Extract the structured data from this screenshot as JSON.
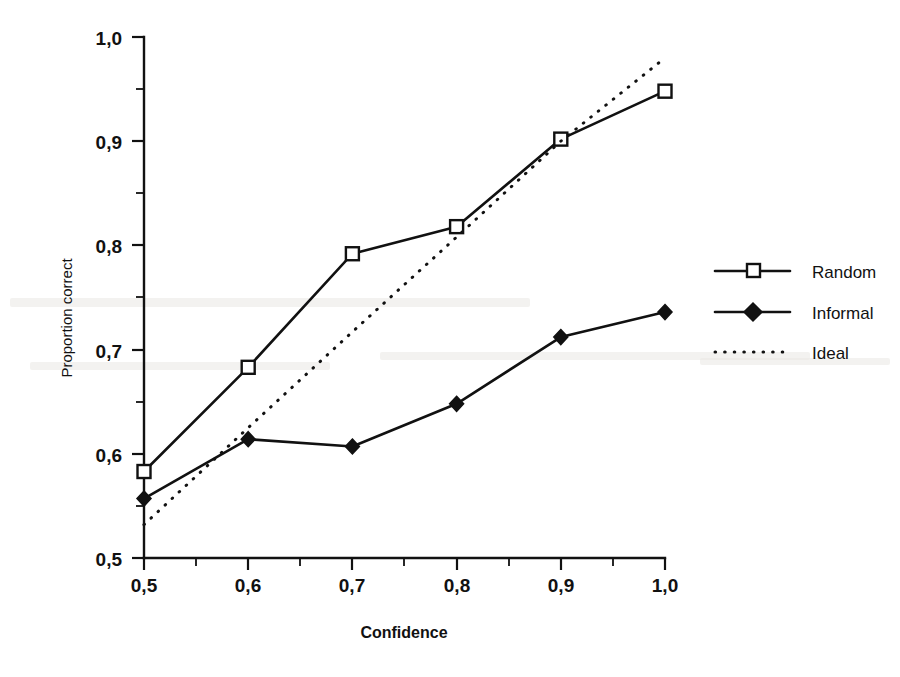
{
  "figure": {
    "background_color": "#ffffff",
    "ink_color": "#111111"
  },
  "axis": {
    "x_title": "Confidence",
    "y_title": "Proportion correct",
    "x_ticks": [
      "0,5",
      "0,6",
      "0,7",
      "0,8",
      "0,9",
      "1,0"
    ],
    "y_ticks": [
      "0,5",
      "0,6",
      "0,7",
      "0,8",
      "0,9",
      "1,0"
    ]
  },
  "legend": {
    "items": [
      {
        "label": "Random",
        "marker": "open-square",
        "line": "solid"
      },
      {
        "label": "Informal",
        "marker": "filled-diamond",
        "line": "solid"
      },
      {
        "label": "Ideal",
        "marker": "none",
        "line": "dotted"
      }
    ]
  },
  "chart_data": {
    "type": "line",
    "title": "",
    "xlabel": "Confidence",
    "ylabel": "Proportion correct",
    "xlim": [
      0.5,
      1.0
    ],
    "ylim": [
      0.5,
      1.0
    ],
    "xticks": [
      0.5,
      0.6,
      0.7,
      0.8,
      0.9,
      1.0
    ],
    "yticks": [
      0.5,
      0.6,
      0.7,
      0.8,
      0.9,
      1.0
    ],
    "xtick_labels": [
      "0,5",
      "0,6",
      "0,7",
      "0,8",
      "0,9",
      "1,0"
    ],
    "ytick_labels": [
      "0,5",
      "0,6",
      "0,7",
      "0,8",
      "0,9",
      "1,0"
    ],
    "minor_tick_step": 0.05,
    "grid": false,
    "legend_position": "right",
    "decimal_separator": ",",
    "x": [
      0.5,
      0.6,
      0.7,
      0.8,
      0.9,
      1.0
    ],
    "series": [
      {
        "name": "Random",
        "marker": "open-square",
        "linestyle": "solid",
        "values": [
          0.583,
          0.683,
          0.792,
          0.818,
          0.902,
          0.948
        ]
      },
      {
        "name": "Informal",
        "marker": "filled-diamond",
        "linestyle": "solid",
        "values": [
          0.557,
          0.614,
          0.607,
          0.648,
          0.712,
          0.736
        ]
      },
      {
        "name": "Ideal",
        "marker": "none",
        "linestyle": "dotted",
        "values": [
          0.532,
          0.625,
          0.717,
          0.808,
          0.9,
          0.98
        ]
      }
    ]
  }
}
